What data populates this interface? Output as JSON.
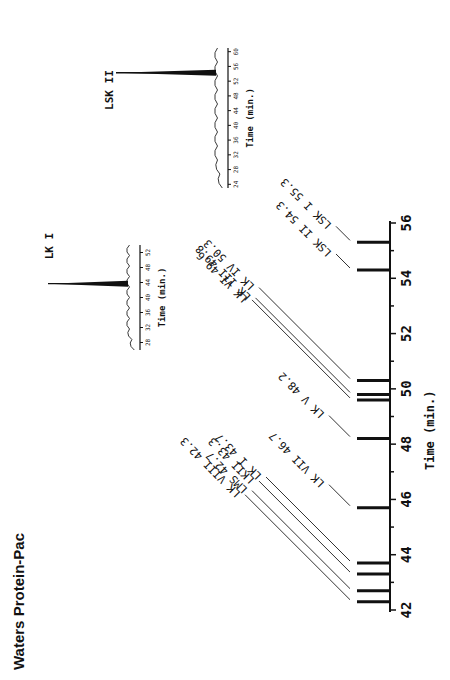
{
  "title": "Waters Protein-Pac",
  "chart_data": [
    {
      "type": "bar",
      "title": "Waters Protein-Pac",
      "subtitle": "Retention times of LK / LSK fractions",
      "xlabel": "Time (min.)",
      "ylabel": "",
      "xlim": [
        42,
        56
      ],
      "x_ticks": [
        42,
        44,
        46,
        48,
        50,
        52,
        54,
        56
      ],
      "orientation": "rotated 90deg counter-clockwise",
      "grid": false,
      "legend": "none",
      "peaks": [
        {
          "label": "LK VIII",
          "time": 42.3
        },
        {
          "label": "LMS",
          "time": 42.7
        },
        {
          "label": "LKII",
          "time": 43.3
        },
        {
          "label": "LK I",
          "time": 43.7
        },
        {
          "label": "LK VII",
          "time": 45.7
        },
        {
          "label": "LK V",
          "time": 48.2
        },
        {
          "label": "LK VI",
          "time": 49.6
        },
        {
          "label": "LK III",
          "time": 49.8
        },
        {
          "label": "LK IV",
          "time": 50.3
        },
        {
          "label": "LSK II",
          "time": 54.3
        },
        {
          "label": "LSK I",
          "time": 55.3
        }
      ],
      "peak_labels_text": [
        "LK VIII 42.3",
        "LMS 42.7",
        "LKII 43.3",
        "LK I 43.7",
        "LK VII 46.7",
        "LK V 48.2",
        "LK VI 49.6",
        "LK III 49.8",
        "LK IV 50.3",
        "LSK II 54.3",
        "LSK I 55.3"
      ]
    },
    {
      "type": "line",
      "title": "LK I",
      "xlabel": "Time (min.)",
      "x_ticks": [
        28,
        32,
        36,
        40,
        44,
        48,
        52
      ],
      "xlim": [
        26,
        54
      ],
      "series": [
        {
          "name": "LK I",
          "peak_time": 43.7
        }
      ]
    },
    {
      "type": "line",
      "title": "LSK II",
      "xlabel": "Time (min.)",
      "x_ticks": [
        24,
        28,
        32,
        36,
        40,
        44,
        48,
        52,
        56,
        60
      ],
      "xlim": [
        23,
        61
      ],
      "series": [
        {
          "name": "LSK II",
          "peak_time": 54.3
        }
      ]
    }
  ]
}
